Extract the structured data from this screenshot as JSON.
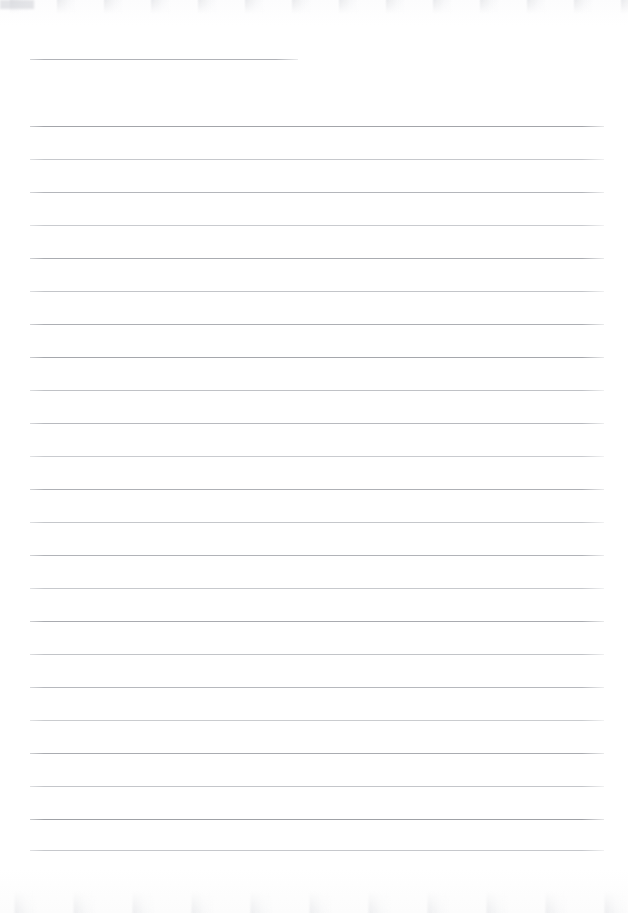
{
  "document": {
    "kind": "scanned-ruled-page",
    "page_width": 628,
    "page_height": 913,
    "background_color": "#ffffff",
    "content_text": "",
    "rule_color_dark": "#a6a8ad",
    "rule_color_light": "#cfd1d5",
    "rule_left_x": 30,
    "rule_right_x": 604,
    "rule_spacing": 33,
    "header_rule": {
      "name": "header-rule",
      "x": 30,
      "y": 59,
      "width": 268,
      "color": "#b0b2b7"
    },
    "rules": [
      {
        "y": 126,
        "x": 30,
        "width": 574,
        "color": "#a3a5aa"
      },
      {
        "y": 159,
        "x": 30,
        "width": 574,
        "color": "#c6c8cc"
      },
      {
        "y": 192,
        "x": 30,
        "width": 574,
        "color": "#b4b6bb"
      },
      {
        "y": 225,
        "x": 30,
        "width": 574,
        "color": "#c9cbcf"
      },
      {
        "y": 258,
        "x": 30,
        "width": 574,
        "color": "#aaacb1"
      },
      {
        "y": 291,
        "x": 30,
        "width": 574,
        "color": "#c3c5c9"
      },
      {
        "y": 324,
        "x": 30,
        "width": 574,
        "color": "#adafb4"
      },
      {
        "y": 357,
        "x": 30,
        "width": 574,
        "color": "#a5a7ac"
      },
      {
        "y": 390,
        "x": 30,
        "width": 574,
        "color": "#c0c2c6"
      },
      {
        "y": 423,
        "x": 30,
        "width": 574,
        "color": "#b8babf"
      },
      {
        "y": 456,
        "x": 30,
        "width": 574,
        "color": "#c9cbcf"
      },
      {
        "y": 489,
        "x": 30,
        "width": 574,
        "color": "#aeb0b5"
      },
      {
        "y": 522,
        "x": 30,
        "width": 574,
        "color": "#c5c7cb"
      },
      {
        "y": 555,
        "x": 30,
        "width": 574,
        "color": "#b1b3b8"
      },
      {
        "y": 588,
        "x": 30,
        "width": 574,
        "color": "#c7c9cd"
      },
      {
        "y": 621,
        "x": 30,
        "width": 574,
        "color": "#a9abb0"
      },
      {
        "y": 654,
        "x": 30,
        "width": 574,
        "color": "#c2c4c8"
      },
      {
        "y": 687,
        "x": 30,
        "width": 574,
        "color": "#b6b8bd"
      },
      {
        "y": 720,
        "x": 30,
        "width": 574,
        "color": "#cacccf"
      },
      {
        "y": 753,
        "x": 30,
        "width": 574,
        "color": "#aaacb1"
      },
      {
        "y": 786,
        "x": 30,
        "width": 574,
        "color": "#c4c6ca"
      },
      {
        "y": 819,
        "x": 30,
        "width": 574,
        "color": "#9fa1a6"
      },
      {
        "y": 850,
        "x": 30,
        "width": 574,
        "color": "#c6c8cc"
      }
    ]
  }
}
